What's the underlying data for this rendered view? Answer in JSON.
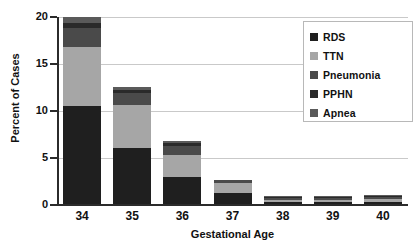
{
  "chart_data": {
    "type": "bar",
    "stacked": true,
    "title": "",
    "xlabel": "Gestational Age",
    "ylabel": "Percent of Cases",
    "categories": [
      "34",
      "35",
      "36",
      "37",
      "38",
      "39",
      "40"
    ],
    "ylim": [
      0,
      20
    ],
    "yticks": [
      0,
      5,
      10,
      15,
      20
    ],
    "ytick_labels": [
      "0",
      "5",
      "10",
      "15",
      "20"
    ],
    "grid": true,
    "legend_position": "top-right",
    "series": [
      {
        "name": "RDS",
        "color": "#1f1f1f",
        "values": [
          10.5,
          6.1,
          3.0,
          1.3,
          0.35,
          0.3,
          0.35
        ]
      },
      {
        "name": "TTN",
        "color": "#a6a6a6",
        "values": [
          6.3,
          4.5,
          2.3,
          1.0,
          0.2,
          0.2,
          0.3
        ]
      },
      {
        "name": "Pneumonia",
        "color": "#4a4a4a",
        "values": [
          2.0,
          1.3,
          1.0,
          0.4,
          0.2,
          0.2,
          0.2
        ]
      },
      {
        "name": "PPHN",
        "color": "#2a2a2a",
        "values": [
          0.6,
          0.35,
          0.25,
          0.0,
          0.1,
          0.1,
          0.15
        ]
      },
      {
        "name": "Apnea",
        "color": "#5a5a5a",
        "values": [
          0.6,
          0.35,
          0.25,
          0.0,
          0.05,
          0.1,
          0.1
        ]
      }
    ],
    "totals": [
      20.0,
      12.6,
      6.8,
      2.7,
      0.9,
      0.9,
      1.1
    ]
  },
  "legend": {
    "items": [
      {
        "label": "RDS"
      },
      {
        "label": "TTN"
      },
      {
        "label": "Pneumonia"
      },
      {
        "label": "PPHN"
      },
      {
        "label": "Apnea"
      }
    ]
  },
  "axes": {
    "y_title": "Percent of Cases",
    "x_title": "Gestational Age"
  },
  "colors": {
    "axis": "#2b2b2b",
    "grid": "#c9c9c9",
    "background": "#ffffff",
    "text": "#111111"
  }
}
